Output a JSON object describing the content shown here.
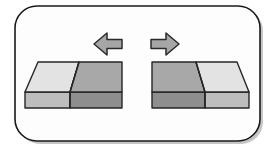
{
  "figure": {
    "name": "split-block-separate-illustration",
    "canvas": {
      "width": 276,
      "height": 155,
      "background": "#ffffff"
    },
    "frame": {
      "name": "rounded-panel",
      "x": 15,
      "y": 6,
      "width": 245,
      "height": 135,
      "corner_radius": 22,
      "fill": "#fdfdfd",
      "stroke": "#1a1a1a",
      "stroke_width": 1.6,
      "shadow_color": "#bdbdbd",
      "shadow_offset_x": 3,
      "shadow_offset_y": 3
    },
    "arrows": [
      {
        "name": "arrow-left",
        "direction": "left",
        "label": "",
        "fill": "#a6a6a6",
        "stroke": "#2b2b2b",
        "center_x": 108,
        "center_y": 44,
        "width": 28,
        "height": 22
      },
      {
        "name": "arrow-right",
        "direction": "right",
        "label": "",
        "fill": "#a6a6a6",
        "stroke": "#2b2b2b",
        "center_x": 165,
        "center_y": 44,
        "width": 28,
        "height": 22
      }
    ],
    "blocks": [
      {
        "name": "block-left",
        "segments": [
          {
            "name": "segment-light",
            "top_fill": "#e3e3e3",
            "front_fill": "#bdbdbd"
          },
          {
            "name": "segment-dark",
            "top_fill": "#a8a8a8",
            "front_fill": "#8e8e8e"
          }
        ],
        "stroke": "#262626",
        "top_back_left_x": 38,
        "top_back_right_x": 122,
        "top_back_y": 62,
        "front_left_x": 25,
        "front_right_x": 122,
        "top_front_y": 92,
        "bottom_y": 108,
        "divider_top_x": 79,
        "divider_front_x": 70
      },
      {
        "name": "block-right",
        "segments": [
          {
            "name": "segment-dark",
            "top_fill": "#a8a8a8",
            "front_fill": "#8e8e8e"
          },
          {
            "name": "segment-light",
            "top_fill": "#e3e3e3",
            "front_fill": "#bdbdbd"
          }
        ],
        "stroke": "#262626",
        "top_back_left_x": 152,
        "top_back_right_x": 237,
        "top_back_y": 62,
        "front_left_x": 152,
        "front_right_x": 249,
        "top_front_y": 92,
        "bottom_y": 108,
        "divider_top_x": 196,
        "divider_front_x": 205
      }
    ]
  }
}
